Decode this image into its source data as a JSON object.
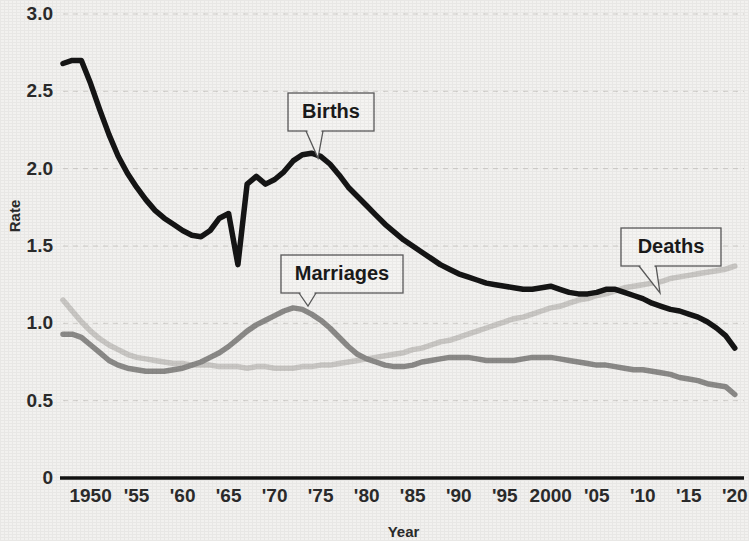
{
  "chart_data": {
    "type": "line",
    "title": "",
    "xlabel": "Year",
    "ylabel": "Rate",
    "xlim": [
      1947,
      2021
    ],
    "ylim": [
      0,
      3.0
    ],
    "grid": true,
    "legend_position": "inline-callouts",
    "y_ticks": [
      "0",
      "0.5",
      "1.0",
      "1.5",
      "2.0",
      "2.5",
      "3.0"
    ],
    "y_tick_values": [
      0,
      0.5,
      1.0,
      1.5,
      2.0,
      2.5,
      3.0
    ],
    "x_ticks": [
      "1950",
      "'55",
      "'60",
      "'65",
      "'70",
      "'75",
      "'80",
      "'85",
      "'90",
      "'95",
      "2000",
      "'05",
      "'10",
      "'15",
      "'20"
    ],
    "x_tick_values": [
      1950,
      1955,
      1960,
      1965,
      1970,
      1975,
      1980,
      1985,
      1990,
      1995,
      2000,
      2005,
      2010,
      2015,
      2020
    ],
    "series": [
      {
        "name": "Births",
        "color": "#151515",
        "width": 5.5,
        "x": [
          1947,
          1948,
          1949,
          1950,
          1951,
          1952,
          1953,
          1954,
          1955,
          1956,
          1957,
          1958,
          1959,
          1960,
          1961,
          1962,
          1963,
          1964,
          1965,
          1966,
          1967,
          1968,
          1969,
          1970,
          1971,
          1972,
          1973,
          1974,
          1975,
          1976,
          1977,
          1978,
          1979,
          1980,
          1981,
          1982,
          1983,
          1984,
          1985,
          1986,
          1987,
          1988,
          1989,
          1990,
          1991,
          1992,
          1993,
          1994,
          1995,
          1996,
          1997,
          1998,
          1999,
          2000,
          2001,
          2002,
          2003,
          2004,
          2005,
          2006,
          2007,
          2008,
          2009,
          2010,
          2011,
          2012,
          2013,
          2014,
          2015,
          2016,
          2017,
          2018,
          2019,
          2020
        ],
        "values": [
          2.68,
          2.7,
          2.7,
          2.55,
          2.38,
          2.22,
          2.08,
          1.97,
          1.88,
          1.8,
          1.73,
          1.68,
          1.64,
          1.6,
          1.57,
          1.56,
          1.6,
          1.68,
          1.71,
          1.38,
          1.9,
          1.95,
          1.9,
          1.93,
          1.98,
          2.05,
          2.09,
          2.1,
          2.08,
          2.03,
          1.96,
          1.88,
          1.82,
          1.76,
          1.7,
          1.64,
          1.59,
          1.54,
          1.5,
          1.46,
          1.42,
          1.38,
          1.35,
          1.32,
          1.3,
          1.28,
          1.26,
          1.25,
          1.24,
          1.23,
          1.22,
          1.22,
          1.23,
          1.24,
          1.22,
          1.2,
          1.19,
          1.19,
          1.2,
          1.22,
          1.22,
          1.2,
          1.18,
          1.16,
          1.13,
          1.11,
          1.09,
          1.08,
          1.06,
          1.04,
          1.01,
          0.97,
          0.92,
          0.84
        ]
      },
      {
        "name": "Deaths",
        "color": "#c9c7c4",
        "width": 5.5,
        "x": [
          1947,
          1948,
          1949,
          1950,
          1951,
          1952,
          1953,
          1954,
          1955,
          1956,
          1957,
          1958,
          1959,
          1960,
          1961,
          1962,
          1963,
          1964,
          1965,
          1966,
          1967,
          1968,
          1969,
          1970,
          1971,
          1972,
          1973,
          1974,
          1975,
          1976,
          1977,
          1978,
          1979,
          1980,
          1981,
          1982,
          1983,
          1984,
          1985,
          1986,
          1987,
          1988,
          1989,
          1990,
          1991,
          1992,
          1993,
          1994,
          1995,
          1996,
          1997,
          1998,
          1999,
          2000,
          2001,
          2002,
          2003,
          2004,
          2005,
          2006,
          2007,
          2008,
          2009,
          2010,
          2011,
          2012,
          2013,
          2014,
          2015,
          2016,
          2017,
          2018,
          2019,
          2020
        ],
        "values": [
          1.15,
          1.08,
          1.01,
          0.95,
          0.9,
          0.86,
          0.83,
          0.8,
          0.78,
          0.77,
          0.76,
          0.75,
          0.74,
          0.74,
          0.73,
          0.73,
          0.73,
          0.72,
          0.72,
          0.72,
          0.71,
          0.72,
          0.72,
          0.71,
          0.71,
          0.71,
          0.72,
          0.72,
          0.73,
          0.73,
          0.74,
          0.75,
          0.76,
          0.77,
          0.78,
          0.79,
          0.8,
          0.81,
          0.83,
          0.84,
          0.86,
          0.88,
          0.89,
          0.91,
          0.93,
          0.95,
          0.97,
          0.99,
          1.01,
          1.03,
          1.04,
          1.06,
          1.08,
          1.1,
          1.11,
          1.13,
          1.15,
          1.16,
          1.18,
          1.19,
          1.21,
          1.23,
          1.24,
          1.25,
          1.26,
          1.27,
          1.29,
          1.3,
          1.31,
          1.32,
          1.33,
          1.34,
          1.35,
          1.37
        ]
      },
      {
        "name": "Marriages",
        "color": "#8b8a88",
        "width": 5.5,
        "x": [
          1947,
          1948,
          1949,
          1950,
          1951,
          1952,
          1953,
          1954,
          1955,
          1956,
          1957,
          1958,
          1959,
          1960,
          1961,
          1962,
          1963,
          1964,
          1965,
          1966,
          1967,
          1968,
          1969,
          1970,
          1971,
          1972,
          1973,
          1974,
          1975,
          1976,
          1977,
          1978,
          1979,
          1980,
          1981,
          1982,
          1983,
          1984,
          1985,
          1986,
          1987,
          1988,
          1989,
          1990,
          1991,
          1992,
          1993,
          1994,
          1995,
          1996,
          1997,
          1998,
          1999,
          2000,
          2001,
          2002,
          2003,
          2004,
          2005,
          2006,
          2007,
          2008,
          2009,
          2010,
          2011,
          2012,
          2013,
          2014,
          2015,
          2016,
          2017,
          2018,
          2019,
          2020
        ],
        "values": [
          0.93,
          0.93,
          0.91,
          0.86,
          0.81,
          0.76,
          0.73,
          0.71,
          0.7,
          0.69,
          0.69,
          0.69,
          0.7,
          0.71,
          0.73,
          0.75,
          0.78,
          0.81,
          0.85,
          0.9,
          0.95,
          0.99,
          1.02,
          1.05,
          1.08,
          1.1,
          1.09,
          1.06,
          1.02,
          0.97,
          0.91,
          0.85,
          0.8,
          0.77,
          0.75,
          0.73,
          0.72,
          0.72,
          0.73,
          0.75,
          0.76,
          0.77,
          0.78,
          0.78,
          0.78,
          0.77,
          0.76,
          0.76,
          0.76,
          0.76,
          0.77,
          0.78,
          0.78,
          0.78,
          0.77,
          0.76,
          0.75,
          0.74,
          0.73,
          0.73,
          0.72,
          0.71,
          0.7,
          0.7,
          0.69,
          0.68,
          0.67,
          0.65,
          0.64,
          0.63,
          0.61,
          0.6,
          0.59,
          0.54
        ]
      }
    ],
    "annotations": [
      {
        "label": "Births",
        "box_x": 288,
        "box_y": 93,
        "box_w": 86,
        "box_h": 38,
        "tail_x": 318,
        "tail_y": 158
      },
      {
        "label": "Marriages",
        "box_x": 281,
        "box_y": 255,
        "box_w": 122,
        "box_h": 38,
        "tail_x": 308,
        "tail_y": 306
      },
      {
        "label": "Deaths",
        "box_x": 621,
        "box_y": 228,
        "box_w": 100,
        "box_h": 38,
        "tail_x": 660,
        "tail_y": 293
      }
    ]
  }
}
